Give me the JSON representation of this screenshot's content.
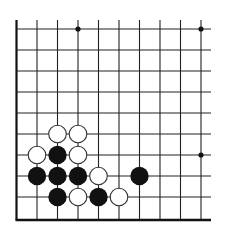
{
  "diagram": {
    "type": "go-board-fragment",
    "corner": "bottom-left",
    "columns": 10,
    "rows": 10,
    "grid": {
      "x0": 16.5,
      "y0": 29,
      "spacing_x": 20.5,
      "spacing_y": 21,
      "top_open_to": 20,
      "right_open_to": 211,
      "line_color": "#222222",
      "border_color": "#111111"
    },
    "star_points": [
      {
        "col": 3,
        "row": 0
      },
      {
        "col": 9,
        "row": 0
      },
      {
        "col": 9,
        "row": 6
      }
    ],
    "stones": [
      {
        "color": "white",
        "col": 2,
        "row": 5
      },
      {
        "color": "white",
        "col": 3,
        "row": 5
      },
      {
        "color": "white",
        "col": 1,
        "row": 6
      },
      {
        "color": "black",
        "col": 2,
        "row": 6
      },
      {
        "color": "white",
        "col": 3,
        "row": 6
      },
      {
        "color": "black",
        "col": 1,
        "row": 7
      },
      {
        "color": "black",
        "col": 2,
        "row": 7
      },
      {
        "color": "black",
        "col": 3,
        "row": 7
      },
      {
        "color": "white",
        "col": 4,
        "row": 7
      },
      {
        "color": "black",
        "col": 6,
        "row": 7
      },
      {
        "color": "black",
        "col": 2,
        "row": 8
      },
      {
        "color": "white",
        "col": 3,
        "row": 8
      },
      {
        "color": "black",
        "col": 4,
        "row": 8
      },
      {
        "color": "white",
        "col": 5,
        "row": 8
      }
    ],
    "colors": {
      "black_stone": "#111111",
      "white_stone_fill": "#ffffff",
      "white_stone_stroke": "#333333",
      "background": "#ffffff"
    }
  }
}
